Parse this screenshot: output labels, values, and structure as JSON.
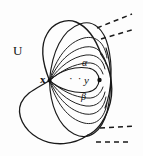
{
  "figure": {
    "type": "topology-diagram",
    "width": 143,
    "height": 156,
    "background_color": "#fdfdfd",
    "ink_color": "#1a1a1a"
  },
  "labels": {
    "set_U": "U",
    "point_x": "x",
    "point_y": "y",
    "curve_alpha": "α",
    "curve_beta": "β",
    "ellipsis": "· ·"
  },
  "points": [
    {
      "name": "x",
      "label": "x",
      "cx": 50,
      "cy": 80,
      "filled": true
    },
    {
      "name": "y",
      "label": "y",
      "cx": 99,
      "cy": 80,
      "filled": true
    }
  ],
  "curves": {
    "outer_boundary_U": "M 50 80 C 40 48 44 24 62 20 C 82 16 100 34 106 58 C 112 84 104 118 86 136 C 62 160 22 142 18 112 C 14 88 30 94 50 80 Z",
    "fan_arcs_count": 10,
    "dashed_segments_count": 4
  },
  "colors": {
    "ink": "#1a1a1a",
    "background": "#fdfdfd",
    "node": "#111111"
  }
}
